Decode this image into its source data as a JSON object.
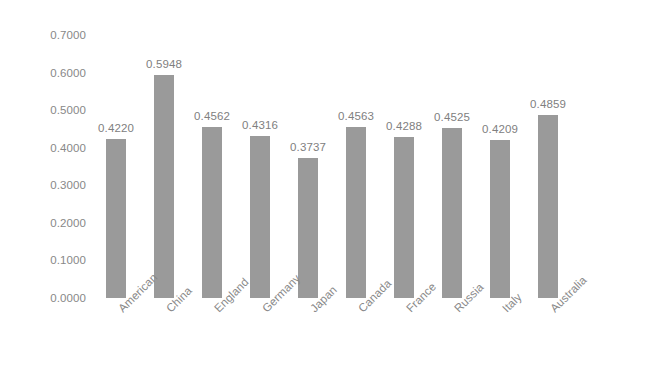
{
  "chart_data": {
    "type": "bar",
    "title": "",
    "subtitle": "",
    "xlabel": "",
    "ylabel": "",
    "categories": [
      "American",
      "China",
      "England",
      "Germany",
      "Japan",
      "Canada",
      "France",
      "Russia",
      "Italy",
      "Australia"
    ],
    "values": [
      0.422,
      0.5948,
      0.4562,
      0.4316,
      0.3737,
      0.4563,
      0.4288,
      0.4525,
      0.4209,
      0.4859
    ],
    "value_labels": [
      "0.4220",
      "0.5948",
      "0.4562",
      "0.4316",
      "0.3737",
      "0.4563",
      "0.4288",
      "0.4525",
      "0.4209",
      "0.4859"
    ],
    "ylim": [
      0.0,
      0.7
    ],
    "y_ticks": [
      0.7,
      0.6,
      0.5,
      0.4,
      0.3,
      0.2,
      0.1,
      0.0
    ],
    "y_tick_labels": [
      "0.7000",
      "0.6000",
      "0.5000",
      "0.4000",
      "0.3000",
      "0.2000",
      "0.1000",
      "0.0000"
    ],
    "grid": false,
    "legend": false,
    "legend_position": "none",
    "bar_color": "#9a9a9a",
    "label_color": "#808080",
    "axis_text_color": "#888888",
    "background_color": "#ffffff",
    "x_tick_label_rotation": -45
  }
}
